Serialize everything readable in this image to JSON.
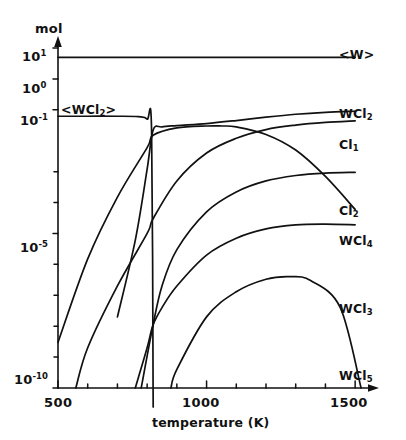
{
  "chart_data": {
    "type": "line",
    "title": "",
    "xlabel": "temperature (K)",
    "ylabel": "mol",
    "xlim": [
      500,
      1550
    ],
    "ylim": [
      1e-10,
      10
    ],
    "yscale": "log",
    "xscale": "linear",
    "grid": false,
    "legend": "inline-right-labels",
    "xticks": [
      500,
      1000,
      1500
    ],
    "xticklabels": [
      "500",
      "1000",
      "1500"
    ],
    "xminorticks": [
      600,
      700,
      800,
      900,
      1100,
      1200,
      1300,
      1400
    ],
    "yticks": [
      10,
      1,
      0.1,
      1e-05,
      1e-10
    ],
    "yticklabels": [
      "10¹",
      "10⁰",
      "10⁻¹",
      "10⁻⁵",
      "10⁻¹⁰"
    ],
    "yminorticks": [
      0.001,
      0.0001,
      1e-06,
      1e-07,
      1e-08,
      1e-09
    ],
    "series": [
      {
        "name": "<W>",
        "label": "<W>",
        "label_base": "W",
        "label_sub": "",
        "bracketed": true,
        "x": [
          500,
          700,
          900,
          1100,
          1300,
          1500
        ],
        "y": [
          5.0,
          5.0,
          5.0,
          5.0,
          5.0,
          5.0
        ]
      },
      {
        "name": "<WCl2>",
        "label": "<WCl2>",
        "label_base": "WCl",
        "label_sub": "2",
        "bracketed": true,
        "x": [
          500,
          600,
          700,
          770,
          800,
          815,
          820,
          820
        ],
        "y": [
          0.062,
          0.062,
          0.062,
          0.06,
          0.05,
          0.02,
          1e-10,
          1e-10
        ]
      },
      {
        "name": "WCl2",
        "label": "WCl2",
        "label_base": "WCl",
        "label_sub": "2",
        "bracketed": false,
        "x": [
          700,
          760,
          800,
          820,
          850,
          900,
          1000,
          1100,
          1200,
          1300,
          1400,
          1500
        ],
        "y": [
          2e-08,
          6e-06,
          0.0012,
          0.022,
          0.028,
          0.031,
          0.036,
          0.045,
          0.058,
          0.072,
          0.083,
          0.09
        ]
      },
      {
        "name": "Cl1",
        "label": "Cl1",
        "label_base": "Cl",
        "label_sub": "1",
        "bracketed": false,
        "x": [
          560,
          600,
          700,
          800,
          820,
          900,
          1000,
          1100,
          1200,
          1300,
          1400,
          1500
        ],
        "y": [
          1e-10,
          2e-09,
          2e-07,
          1e-05,
          3e-05,
          0.0005,
          0.004,
          0.012,
          0.023,
          0.032,
          0.039,
          0.044
        ]
      },
      {
        "name": "Cl2",
        "label": "Cl2",
        "label_base": "Cl",
        "label_sub": "2",
        "bracketed": false,
        "x": [
          780,
          820,
          850,
          900,
          1000,
          1100,
          1200,
          1300,
          1400,
          1500
        ],
        "y": [
          1e-10,
          1.1e-08,
          2e-07,
          3e-06,
          5e-05,
          0.00022,
          0.0005,
          0.00075,
          0.0009,
          0.00095
        ]
      },
      {
        "name": "WCl3",
        "label": "WCl3",
        "label_base": "WCl",
        "label_sub": "3",
        "bracketed": false,
        "x": [
          760,
          800,
          820,
          850,
          900,
          1000,
          1100,
          1200,
          1300,
          1400,
          1500
        ],
        "y": [
          1e-10,
          2e-09,
          1.1e-08,
          4e-08,
          2e-07,
          2e-06,
          7e-06,
          1.4e-05,
          1.9e-05,
          2e-05,
          1.9e-05
        ]
      },
      {
        "name": "WCl4",
        "label": "WCl4",
        "label_base": "WCl",
        "label_sub": "4",
        "bracketed": false,
        "x": [
          500,
          600,
          700,
          800,
          820,
          900,
          1000,
          1050,
          1100,
          1200,
          1300,
          1400,
          1500
        ],
        "y": [
          3e-09,
          1.5e-06,
          0.00015,
          0.006,
          0.015,
          0.026,
          0.03,
          0.03,
          0.028,
          0.016,
          0.005,
          0.0007,
          6e-05
        ]
      },
      {
        "name": "WCl5",
        "label": "WCl5",
        "label_base": "WCl",
        "label_sub": "5",
        "bracketed": false,
        "x": [
          880,
          900,
          1000,
          1100,
          1200,
          1280,
          1350,
          1450,
          1520
        ],
        "y": [
          1e-10,
          4e-10,
          2e-08,
          1.3e-07,
          3.3e-07,
          4e-07,
          3e-07,
          4e-08,
          1e-10
        ]
      }
    ]
  },
  "axes": {
    "ylabel_text": "mol",
    "xlabel_text": "temperature (K)",
    "ytick_labels": [
      {
        "mantissa": "10",
        "exp": "1"
      },
      {
        "mantissa": "10",
        "exp": "0"
      },
      {
        "mantissa": "10",
        "exp": "-1"
      },
      {
        "mantissa": "10",
        "exp": "-5"
      },
      {
        "mantissa": "10",
        "exp": "-10"
      }
    ],
    "xtick_labels": [
      "500",
      "1000",
      "1500"
    ]
  },
  "curve_labels": {
    "w_solid": "<W>",
    "wcl2_solid": "<WCl",
    "wcl2_solid_sub": "2",
    "wcl2_solid_close": ">",
    "wcl2": "WCl",
    "wcl2_sub": "2",
    "cl1": "Cl",
    "cl1_sub": "1",
    "cl2": "Cl",
    "cl2_sub": "2",
    "wcl4": "WCl",
    "wcl4_sub": "4",
    "wcl3": "WCl",
    "wcl3_sub": "3",
    "wcl5": "WCl",
    "wcl5_sub": "5"
  },
  "style": {
    "line_color": "#111111",
    "background": "#ffffff",
    "axis_color": "#111111"
  }
}
